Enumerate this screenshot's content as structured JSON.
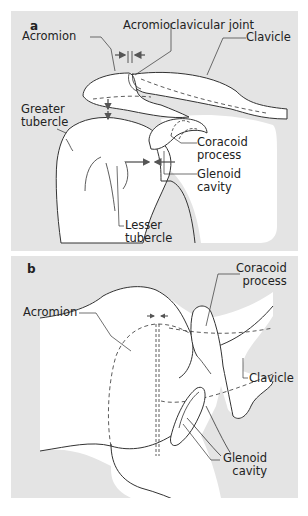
{
  "panels": [
    {
      "id": "a",
      "label": "a",
      "labels": {
        "acromioclavicular_joint": "Acromioclavicular joint",
        "acromion": "Acromion",
        "clavicle": "Clavicle",
        "greater_tubercle_1": "Greater",
        "greater_tubercle_2": "tubercle",
        "coracoid_process_1": "Coracoid",
        "coracoid_process_2": "process",
        "glenoid_cavity_1": "Glenoid",
        "glenoid_cavity_2": "cavity",
        "lesser_tubercle_1": "Lesser",
        "lesser_tubercle_2": "tubercle"
      }
    },
    {
      "id": "b",
      "label": "b",
      "labels": {
        "coracoid_process_1": "Coracoid",
        "coracoid_process_2": "process",
        "acromion": "Acromion",
        "clavicle": "Clavicle",
        "glenoid_cavity_1": "Glenoid",
        "glenoid_cavity_2": "cavity"
      }
    }
  ],
  "colors": {
    "panel_bg": "#e4e4e4",
    "bone_fill": "#ffffff",
    "line": "#333333",
    "arrow": "#555555"
  }
}
